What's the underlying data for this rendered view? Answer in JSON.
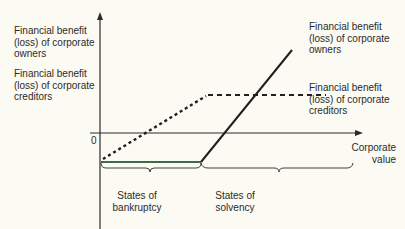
{
  "diagram": {
    "y_axis_labels": {
      "owners": "Financial benefit\n(loss) of corporate\nowners",
      "creditors": "Financial benefit\n(loss) of corporate\ncreditors"
    },
    "line_labels": {
      "owners": "Financial benefit\n(loss) of corporate\nowners",
      "creditors": "Financial benefit\n(loss) of corporate\ncreditors"
    },
    "origin_label": "0",
    "x_axis_label": "Corporate\nvalue",
    "brace_labels": {
      "bankruptcy": "States of\nbankruptcy",
      "solvency": "States of\nsolvency"
    },
    "colors": {
      "background": "#fbfaf3",
      "axis": "#2a2a2a",
      "owners_line": "#1f1f1f",
      "owners_flat_segment": "#3f6b4a",
      "creditors_line": "#1f1f1f"
    },
    "series": [
      {
        "name": "Financial benefit (loss) of corporate owners",
        "style": "solid",
        "shape": "flat loss in bankruptcy, rising linearly in solvency"
      },
      {
        "name": "Financial benefit (loss) of corporate creditors",
        "style": "dashed",
        "shape": "rising linearly in bankruptcy, flat in solvency"
      }
    ]
  }
}
